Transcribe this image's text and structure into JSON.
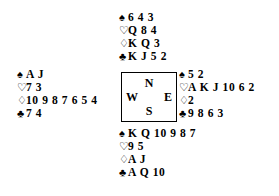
{
  "diagram": {
    "type": "bridge-hand-deal",
    "suit_glyphs": {
      "spades": "♠",
      "hearts": "♡",
      "diamonds": "♢",
      "clubs": "♣"
    },
    "compass": {
      "north": "N",
      "east": "E",
      "south": "S",
      "west": "W"
    },
    "hands": {
      "north": {
        "spades": "6 4 3",
        "hearts": "Q 8 4",
        "diamonds": "K Q 3",
        "clubs": "K J 5 2"
      },
      "west": {
        "spades": "A J",
        "hearts": "7 3",
        "diamonds": "10 9 8 7 6 5 4",
        "clubs": "7 4"
      },
      "east": {
        "spades": "5 2",
        "hearts": "A K J 10 6 2",
        "diamonds": "2",
        "clubs": "9 8 6 3"
      },
      "south": {
        "spades": "K Q 10 9 8 7",
        "hearts": "9 5",
        "diamonds": "A J",
        "clubs": "A Q 10"
      }
    },
    "colors": {
      "ink": "#000000",
      "background": "#ffffff"
    }
  }
}
